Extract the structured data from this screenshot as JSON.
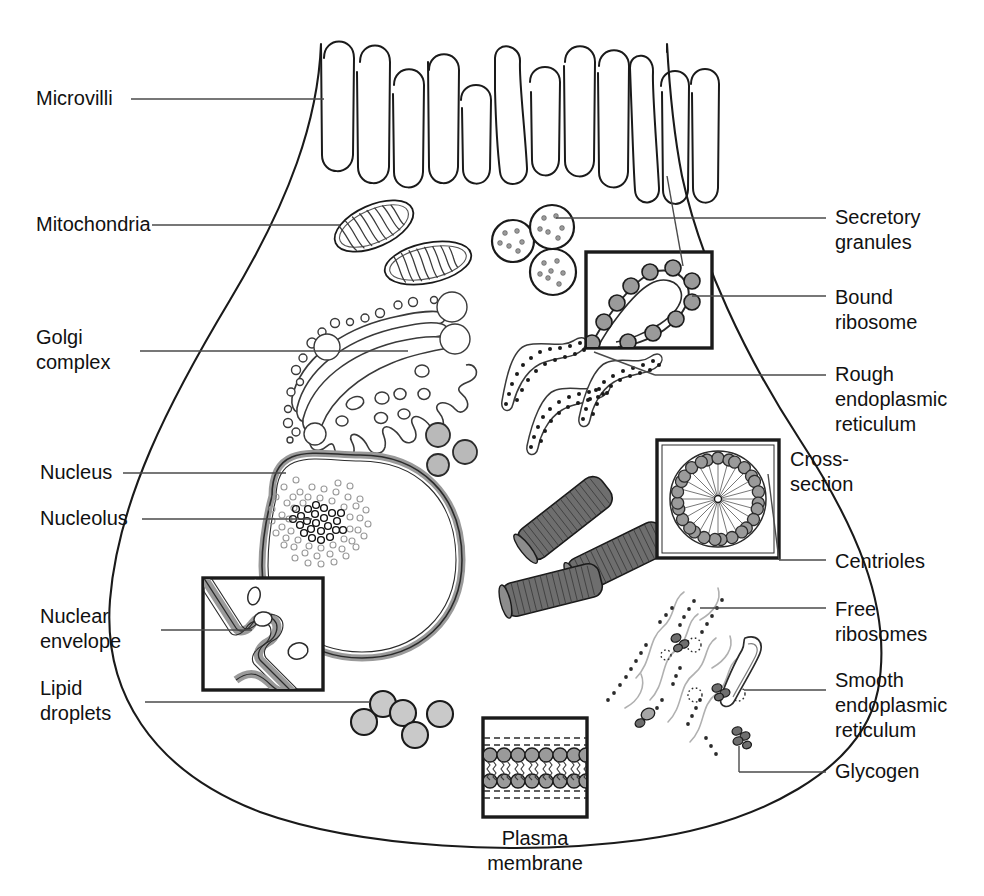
{
  "figure": {
    "kind": "labeled-biology-diagram",
    "background_color": "#ffffff",
    "ink_color": "#1a1a1a",
    "fill_gray": "#9a9a9a",
    "fill_light_gray": "#c9c9c9",
    "fill_dark_gray": "#6e6e6e"
  },
  "labels_left": [
    {
      "id": "microvilli",
      "text": "Microvilli",
      "x": 36,
      "y": 86,
      "lines": [
        "Microvilli"
      ]
    },
    {
      "id": "mitochondria",
      "text": "Mitochondria",
      "x": 36,
      "y": 212,
      "lines": [
        "Mitochondria"
      ]
    },
    {
      "id": "golgi-complex",
      "text": "Golgi complex",
      "x": 36,
      "y": 325,
      "lines": [
        "Golgi",
        "complex"
      ]
    },
    {
      "id": "nucleus",
      "text": "Nucleus",
      "x": 40,
      "y": 460,
      "lines": [
        "Nucleus"
      ]
    },
    {
      "id": "nucleolus",
      "text": "Nucleolus",
      "x": 40,
      "y": 506,
      "lines": [
        "Nucleolus"
      ]
    },
    {
      "id": "nuclear-envelope",
      "text": "Nuclear envelope",
      "x": 40,
      "y": 604,
      "lines": [
        "Nuclear",
        "envelope"
      ]
    },
    {
      "id": "lipid-droplets",
      "text": "Lipid droplets",
      "x": 40,
      "y": 676,
      "lines": [
        "Lipid",
        "droplets"
      ]
    }
  ],
  "labels_right": [
    {
      "id": "secretory-granules",
      "text": "Secretory granules",
      "x": 835,
      "y": 205,
      "lines": [
        "Secretory",
        "granules"
      ]
    },
    {
      "id": "bound-ribosome",
      "text": "Bound ribosome",
      "x": 835,
      "y": 285,
      "lines": [
        "Bound",
        "ribosome"
      ]
    },
    {
      "id": "rough-er",
      "text": "Rough endoplasmic reticulum",
      "x": 835,
      "y": 362,
      "lines": [
        "Rough",
        "endoplasmic",
        "reticulum"
      ]
    },
    {
      "id": "cross-section",
      "text": "Cross-section",
      "x": 790,
      "y": 447,
      "lines": [
        "Cross-",
        "section"
      ]
    },
    {
      "id": "centrioles",
      "text": "Centrioles",
      "x": 835,
      "y": 549,
      "lines": [
        "Centrioles"
      ]
    },
    {
      "id": "free-ribosomes",
      "text": "Free ribosomes",
      "x": 835,
      "y": 597,
      "lines": [
        "Free",
        "ribosomes"
      ]
    },
    {
      "id": "smooth-er",
      "text": "Smooth endoplasmic reticulum",
      "x": 835,
      "y": 668,
      "lines": [
        "Smooth",
        "endoplasmic",
        "reticulum"
      ]
    },
    {
      "id": "glycogen",
      "text": "Glycogen",
      "x": 835,
      "y": 759,
      "lines": [
        "Glycogen"
      ]
    }
  ],
  "labels_bottom": [
    {
      "id": "plasma-membrane",
      "text": "Plasma membrane",
      "x": 517,
      "y": 838,
      "lines": [
        "Plasma",
        "membrane"
      ]
    }
  ],
  "insets": [
    {
      "id": "bound-ribosome-inset",
      "title": "Bound ribosome detail",
      "x": 586,
      "y": 252,
      "w": 126,
      "h": 96
    },
    {
      "id": "cross-section-inset",
      "title": "Cross-section",
      "x": 657,
      "y": 440,
      "w": 122,
      "h": 118
    },
    {
      "id": "nuclear-envelope-inset",
      "title": "Nuclear envelope detail",
      "x": 203,
      "y": 578,
      "w": 120,
      "h": 112
    },
    {
      "id": "plasma-membrane-inset",
      "title": "Plasma membrane detail",
      "x": 483,
      "y": 718,
      "w": 104,
      "h": 99
    }
  ],
  "organelles": [
    {
      "id": "microvilli",
      "name": "Microvilli",
      "count": 13
    },
    {
      "id": "mitochondria",
      "name": "Mitochondria",
      "count": 2
    },
    {
      "id": "secretory-granules",
      "name": "Secretory granules",
      "count": 3
    },
    {
      "id": "golgi",
      "name": "Golgi complex",
      "count": 1
    },
    {
      "id": "nucleus",
      "name": "Nucleus",
      "count": 1
    },
    {
      "id": "nucleolus",
      "name": "Nucleolus",
      "count": 1
    },
    {
      "id": "rough-er",
      "name": "Rough endoplasmic reticulum",
      "count": 3
    },
    {
      "id": "smooth-er",
      "name": "Smooth endoplasmic reticulum",
      "count": 1
    },
    {
      "id": "centrioles",
      "name": "Centrioles",
      "count": 3
    },
    {
      "id": "lipid-droplets",
      "name": "Lipid droplets",
      "count": 5
    },
    {
      "id": "free-ribosomes",
      "name": "Free ribosomes",
      "count": 1
    },
    {
      "id": "glycogen",
      "name": "Glycogen granules",
      "count": 5
    }
  ]
}
